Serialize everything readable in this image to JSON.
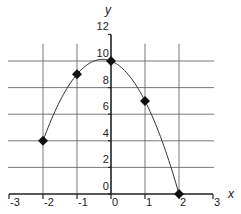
{
  "chart_data": {
    "type": "scatter",
    "title": "",
    "xlabel": "x",
    "ylabel": "y",
    "xlim": [
      -3,
      3
    ],
    "ylim": [
      0,
      12
    ],
    "grid": true,
    "x_ticks": [
      "-3",
      "-2",
      "-1",
      "0",
      "1",
      "2",
      "3"
    ],
    "y_ticks": [
      "0",
      "2",
      "4",
      "6",
      "8",
      "10",
      "12"
    ],
    "series": [
      {
        "name": "points",
        "marker": "diamond",
        "x": [
          -2,
          -1,
          0,
          1,
          2
        ],
        "y": [
          4,
          9,
          10,
          7,
          0
        ]
      },
      {
        "name": "curve",
        "type": "line",
        "smooth": true,
        "equation": "y = 10 - x - 2x^2",
        "x": [
          -2,
          -1,
          0,
          1,
          2
        ],
        "y": [
          4,
          9,
          10,
          7,
          0
        ]
      }
    ],
    "colors": {
      "line": "#333333",
      "grid": "#555555",
      "marker": "#111111"
    }
  }
}
